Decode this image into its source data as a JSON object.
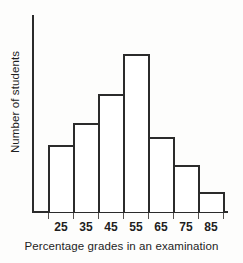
{
  "chart_data": {
    "type": "bar",
    "title": "",
    "subtitle": "",
    "xlabel": "Percentage grades in an examination",
    "ylabel": "Number of students",
    "categories": [
      "25",
      "35",
      "45",
      "55",
      "65",
      "75",
      "85"
    ],
    "values": [
      3.4,
      4.5,
      6.0,
      8.0,
      3.8,
      2.4,
      1.0
    ],
    "ylim": [
      0,
      10
    ],
    "xlim": [
      20,
      90
    ],
    "grid": false,
    "legend": null,
    "legend_position": "none",
    "axis_tick_labels_y": [],
    "annotations": [],
    "bar_style": {
      "fill": "#ffffff",
      "outline": "#2b2b2b",
      "gap": 0
    }
  },
  "axes": {
    "x_tick_labels": [
      "25",
      "35",
      "45",
      "55",
      "65",
      "75",
      "85"
    ],
    "x_axis_title": "Percentage grades in an examination",
    "y_axis_title": "Number of students"
  },
  "colors": {
    "background": "#fdfdfc",
    "ink": "#2b2b2b",
    "tick": "#55514e",
    "bar_fill": "#ffffff"
  }
}
